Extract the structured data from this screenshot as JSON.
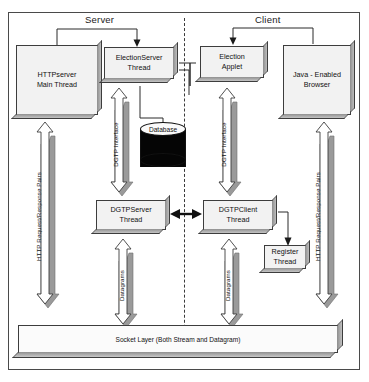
{
  "diagram": {
    "zones": [
      {
        "id": "server",
        "label": "Server"
      },
      {
        "id": "client",
        "label": "Client"
      }
    ],
    "divider": {
      "style": "dashed",
      "meaning": "server-client boundary"
    },
    "boxes": [
      {
        "id": "httpserver",
        "label": "HTTPserver\nMain Thread",
        "line1": "HTTPserver",
        "line2": "Main Thread",
        "side": "server"
      },
      {
        "id": "electionserver",
        "label": "ElectionServer\nThread",
        "line1": "ElectionServer",
        "line2": "Thread",
        "side": "server"
      },
      {
        "id": "electionapplet",
        "label": "Election\nApplet",
        "line1": "Election",
        "line2": "Applet",
        "side": "client"
      },
      {
        "id": "javabrowser",
        "label": "Java - Enabled\nBrowser",
        "line1": "Java - Enabled",
        "line2": "Browser",
        "side": "client"
      },
      {
        "id": "dgtpserver",
        "label": "DGTPServer\nThread",
        "line1": "DGTPServer",
        "line2": "Thread",
        "side": "server"
      },
      {
        "id": "dgtpclient",
        "label": "DGTPClient\nThread",
        "line1": "DGTPClient",
        "line2": "Thread",
        "side": "client"
      },
      {
        "id": "registerthread",
        "label": "Register\nThread",
        "line1": "Register",
        "line2": "Thread",
        "side": "client"
      }
    ],
    "database": {
      "id": "database",
      "label": "Database"
    },
    "socket_layer": {
      "id": "socket-layer",
      "label": "Socket Layer (Both Stream and Datagram)"
    },
    "flow_labels": [
      {
        "id": "http-left",
        "label": "HTTP Request/Response Pairs",
        "side": "server"
      },
      {
        "id": "dgtp-server",
        "label": "DGTP Interface",
        "side": "server"
      },
      {
        "id": "dgtp-client",
        "label": "DGTP Interface",
        "side": "client"
      },
      {
        "id": "http-right",
        "label": "HTTP Request/Response Pairs",
        "side": "client"
      },
      {
        "id": "datagrams-server",
        "label": "Datagrams",
        "side": "server"
      },
      {
        "id": "datagrams-client",
        "label": "Datagrams",
        "side": "client"
      }
    ],
    "colors": {
      "outline": "#3d3d3d",
      "box_fill": "#f2f2f2",
      "extrusion": "#9a9a9a",
      "arrow_fill": "#ffffff",
      "arrow_shadow": "#9a9a9a",
      "database_body": "#050505",
      "page_background": "#ffffff"
    }
  }
}
